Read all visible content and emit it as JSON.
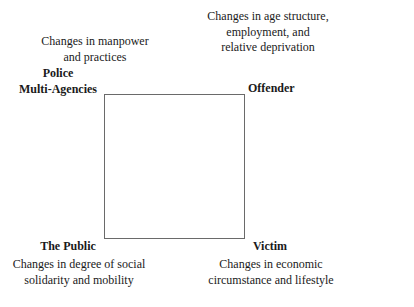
{
  "diagram": {
    "type": "square-framework",
    "corners": {
      "top_left": {
        "description_lines": [
          "Changes in manpower",
          "and practices"
        ],
        "label_lines": [
          "Police",
          "Multi-Agencies"
        ]
      },
      "top_right": {
        "description_lines": [
          "Changes in age structure,",
          "employment, and",
          "relative deprivation"
        ],
        "label": "Offender"
      },
      "bottom_left": {
        "label": "The Public",
        "description_lines": [
          "Changes in degree of social",
          "solidarity and mobility"
        ]
      },
      "bottom_right": {
        "label": "Victim",
        "description_lines": [
          "Changes in economic",
          "circumstance and lifestyle"
        ]
      }
    }
  }
}
